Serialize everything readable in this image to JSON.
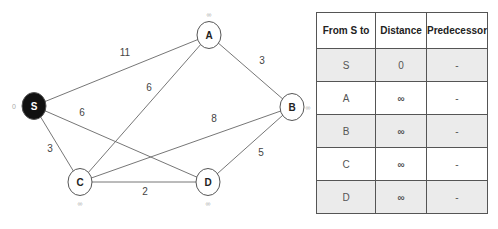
{
  "graph": {
    "nodes": [
      {
        "id": "S",
        "x": 34,
        "y": 106,
        "label": "S",
        "dist_label": "0",
        "lx": 14,
        "ly": 109,
        "source": true
      },
      {
        "id": "A",
        "x": 209,
        "y": 35,
        "label": "A",
        "dist_label": "∞",
        "lx": 209,
        "ly": 17,
        "source": false
      },
      {
        "id": "B",
        "x": 292,
        "y": 107,
        "label": "B",
        "dist_label": "∞",
        "lx": 308,
        "ly": 110,
        "source": false
      },
      {
        "id": "C",
        "x": 80,
        "y": 182,
        "label": "C",
        "dist_label": "∞",
        "lx": 80,
        "ly": 206,
        "source": false
      },
      {
        "id": "D",
        "x": 208,
        "y": 182,
        "label": "D",
        "dist_label": "∞",
        "lx": 208,
        "ly": 206,
        "source": false
      }
    ],
    "edges": [
      {
        "from": "S",
        "to": "A",
        "weight": "11",
        "wx": 125,
        "wy": 56
      },
      {
        "from": "S",
        "to": "D",
        "weight": "6",
        "wx": 82,
        "wy": 116
      },
      {
        "from": "S",
        "to": "C",
        "weight": "3",
        "wx": 50,
        "wy": 152
      },
      {
        "from": "C",
        "to": "A",
        "weight": "6",
        "wx": 149,
        "wy": 91
      },
      {
        "from": "C",
        "to": "B",
        "weight": "8",
        "wx": 214,
        "wy": 122
      },
      {
        "from": "C",
        "to": "D",
        "weight": "2",
        "wx": 145,
        "wy": 195
      },
      {
        "from": "A",
        "to": "B",
        "weight": "3",
        "wx": 262,
        "wy": 64
      },
      {
        "from": "D",
        "to": "B",
        "weight": "5",
        "wx": 261,
        "wy": 156
      }
    ],
    "colors": {
      "source_fill": "#111111",
      "node_fill": "#ffffff",
      "stroke": "#555555",
      "edge": "#666666",
      "label": "#444444",
      "dist_label": "#aaaaaa"
    }
  },
  "table": {
    "headers": [
      "From S to",
      "Distance",
      "Predecessor"
    ],
    "rows": [
      {
        "node": "S",
        "distance": "0",
        "predecessor": "-"
      },
      {
        "node": "A",
        "distance": "∞",
        "predecessor": "-"
      },
      {
        "node": "B",
        "distance": "∞",
        "predecessor": "-"
      },
      {
        "node": "C",
        "distance": "∞",
        "predecessor": "-"
      },
      {
        "node": "D",
        "distance": "∞",
        "predecessor": "-"
      }
    ]
  }
}
